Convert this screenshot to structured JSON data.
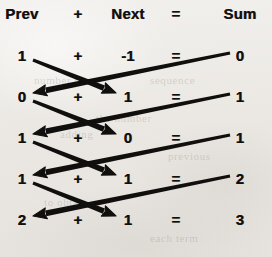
{
  "figure": {
    "ink_color": "#100f0e",
    "paper_color": "#eeece9"
  },
  "header": {
    "prev": "Prev",
    "plus": "+",
    "next": "Next",
    "equals": "=",
    "sum": "Sum"
  },
  "columns": {
    "prev_x": 22,
    "plus_x": 78,
    "next_x": 128,
    "equals_x": 176,
    "sum_x": 240,
    "header_y": 13
  },
  "rows": [
    {
      "prev": "1",
      "plus": "+",
      "next": "-1",
      "equals": "=",
      "sum": "0",
      "y": 55
    },
    {
      "prev": "0",
      "plus": "+",
      "next": "1",
      "equals": "=",
      "sum": "1",
      "y": 96
    },
    {
      "prev": "1",
      "plus": "+",
      "next": "0",
      "equals": "=",
      "sum": "1",
      "y": 137
    },
    {
      "prev": "1",
      "plus": "+",
      "next": "1",
      "equals": "=",
      "sum": "2",
      "y": 178
    },
    {
      "prev": "2",
      "plus": "+",
      "next": "1",
      "equals": "=",
      "sum": "3",
      "y": 219
    }
  ],
  "arrows": {
    "description": "Each row's Prev flows down-right into the following row's Next; each row's Sum flows down-left into the following row's Prev.",
    "stroke_width": 4.6,
    "head_length": 13,
    "head_width": 11,
    "prev_to_next": [
      {
        "from_row": 0,
        "to_row": 1,
        "x1": 33,
        "y1": 60,
        "x2": 116,
        "y2": 93
      },
      {
        "from_row": 1,
        "to_row": 2,
        "x1": 33,
        "y1": 101,
        "x2": 116,
        "y2": 134
      },
      {
        "from_row": 2,
        "to_row": 3,
        "x1": 33,
        "y1": 142,
        "x2": 116,
        "y2": 175
      },
      {
        "from_row": 3,
        "to_row": 4,
        "x1": 33,
        "y1": 183,
        "x2": 116,
        "y2": 216
      }
    ],
    "sum_to_prev": [
      {
        "from_row": 0,
        "to_row": 1,
        "x1": 230,
        "y1": 53,
        "x2": 33,
        "y2": 93
      },
      {
        "from_row": 1,
        "to_row": 2,
        "x1": 230,
        "y1": 94,
        "x2": 33,
        "y2": 134
      },
      {
        "from_row": 2,
        "to_row": 3,
        "x1": 230,
        "y1": 135,
        "x2": 33,
        "y2": 175
      },
      {
        "from_row": 3,
        "to_row": 4,
        "x1": 230,
        "y1": 176,
        "x2": 33,
        "y2": 216
      }
    ]
  },
  "ghost_text": [
    {
      "text": "number the",
      "x": 34,
      "y": 74
    },
    {
      "text": "sequence",
      "x": 150,
      "y": 74
    },
    {
      "text": "the number",
      "x": 96,
      "y": 112
    },
    {
      "text": "adding",
      "x": 60,
      "y": 128
    },
    {
      "text": "previous",
      "x": 168,
      "y": 150
    },
    {
      "text": "to obtain",
      "x": 44,
      "y": 196
    },
    {
      "text": "each term",
      "x": 150,
      "y": 232
    }
  ]
}
